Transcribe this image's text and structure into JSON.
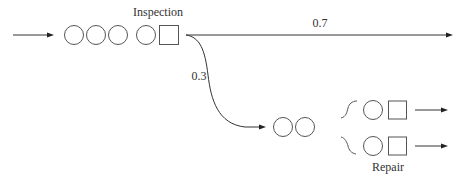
{
  "diagram": {
    "type": "queueing-network",
    "labels": {
      "inspection": "Inspection",
      "repair": "Repair",
      "pass_probability": "0.7",
      "rework_probability": "0.3"
    },
    "nodes": [
      {
        "id": "arrival",
        "kind": "input-arrow"
      },
      {
        "id": "inspection-queue",
        "kind": "queue",
        "waiting_circles": 3
      },
      {
        "id": "inspection-station",
        "kind": "server",
        "label": "Inspection",
        "circles": 1,
        "servers": 1
      },
      {
        "id": "repair-queue",
        "kind": "queue",
        "waiting_circles": 2
      },
      {
        "id": "repair-station-1",
        "kind": "server",
        "label": "Repair",
        "circles": 1,
        "servers": 1
      },
      {
        "id": "repair-station-2",
        "kind": "server",
        "label": "Repair",
        "circles": 1,
        "servers": 1
      }
    ],
    "edges": [
      {
        "from": "arrival",
        "to": "inspection-queue"
      },
      {
        "from": "inspection-station",
        "to": "exit",
        "probability": "0.7"
      },
      {
        "from": "inspection-station",
        "to": "repair-queue",
        "probability": "0.3"
      },
      {
        "from": "repair-queue",
        "to": "repair-station-1"
      },
      {
        "from": "repair-queue",
        "to": "repair-station-2"
      },
      {
        "from": "repair-station-1",
        "to": "exit"
      },
      {
        "from": "repair-station-2",
        "to": "exit"
      }
    ],
    "colors": {
      "line": "#333333",
      "shape_stroke": "#555555",
      "text": "#333333",
      "background": "#ffffff"
    }
  }
}
